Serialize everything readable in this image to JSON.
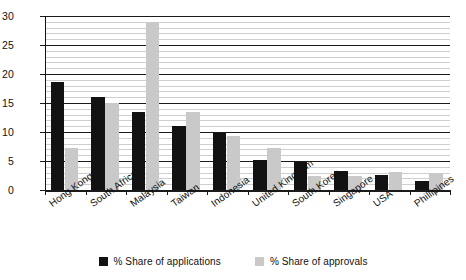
{
  "chart_data": {
    "type": "bar",
    "title": "",
    "subtitle": "",
    "xlabel": "",
    "ylabel": "",
    "ylim": [
      0,
      30
    ],
    "yticks": [
      0,
      5,
      10,
      15,
      20,
      25,
      30
    ],
    "ytick_labels": [
      "0",
      "5",
      "10",
      "15",
      "20",
      "25",
      "30"
    ],
    "grid": "horizontal-minor-every-1-major-every-5",
    "legend_position": "bottom-center",
    "categories": [
      "Hong Kong",
      "South Africa",
      "Malaysia",
      "Taiwan",
      "Indonesia",
      "United Kingdom",
      "South Korea",
      "Singapore",
      "USA",
      "Phillipines"
    ],
    "series": [
      {
        "name": "% Share of applications",
        "color": "#121212",
        "values": [
          18.7,
          16.0,
          13.4,
          11.1,
          9.9,
          5.1,
          4.8,
          3.3,
          2.6,
          1.5
        ]
      },
      {
        "name": "% Share of approvals",
        "color": "#c9c9c9",
        "values": [
          7.2,
          15.0,
          29.0,
          13.4,
          9.3,
          7.2,
          2.4,
          2.5,
          3.1,
          3.0
        ]
      }
    ]
  },
  "legend": {
    "items": [
      {
        "label": "% Share of applications",
        "swatch": "dark-square-icon"
      },
      {
        "label": "% Share of approvals",
        "swatch": "light-square-icon"
      }
    ]
  }
}
